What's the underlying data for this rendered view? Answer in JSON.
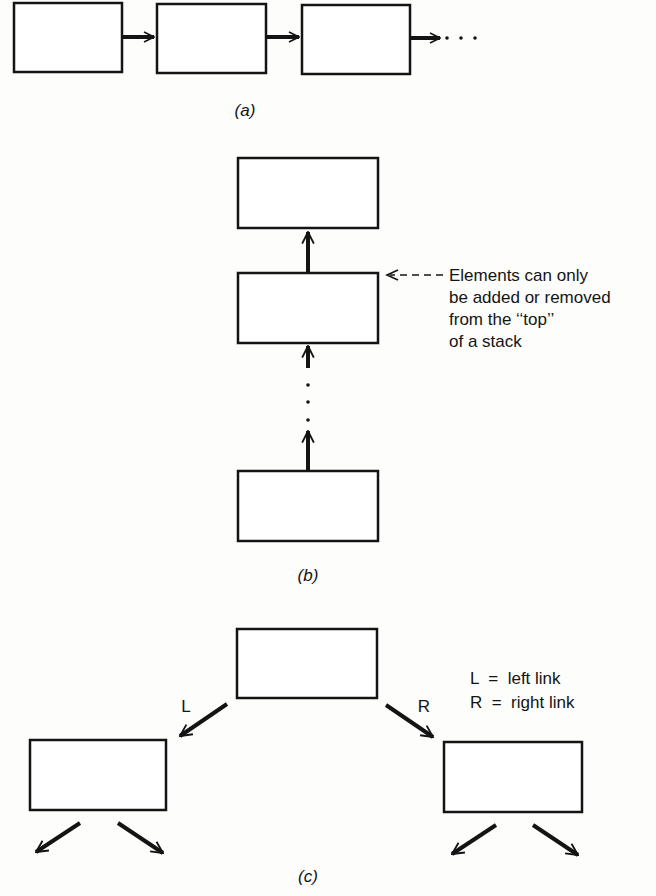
{
  "figure": {
    "parts": [
      {
        "id": "a",
        "caption": "(a)",
        "description": "Linked list: chain of nodes connected by forward links",
        "nodes": 3,
        "continuation": "· · ·"
      },
      {
        "id": "b",
        "caption": "(b)",
        "description": "Stack: nodes linked upward",
        "nodes": 3,
        "annotation": {
          "lines": [
            "Elements can only",
            "be added or removed",
            "from the ‘‘top’’",
            "of a stack"
          ]
        }
      },
      {
        "id": "c",
        "caption": "(c)",
        "description": "Binary tree: each node has a left and right link",
        "nodes": 3,
        "link_labels": {
          "left": "L",
          "right": "R"
        },
        "legend": [
          "L  =  left link",
          "R  =  right link"
        ]
      }
    ]
  },
  "colors": {
    "ink": "#141414",
    "paper": "#fdfdfb"
  }
}
